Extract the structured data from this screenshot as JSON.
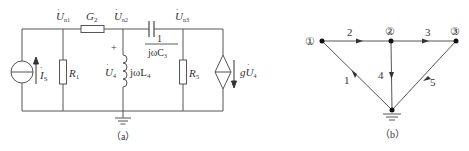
{
  "figure_a": {
    "caption": "（a）",
    "nodes": {
      "n1": {
        "label": "U",
        "sub": "n1"
      },
      "n2": {
        "label": "U",
        "sub": "n2"
      },
      "n3": {
        "label": "U",
        "sub": "n3"
      }
    },
    "components": {
      "current_source": {
        "label": "I",
        "sub": "S"
      },
      "r1": {
        "label": "R",
        "sub": "1"
      },
      "g2": {
        "label": "G",
        "sub": "2"
      },
      "inductor": {
        "label": "jωL",
        "sub": "4"
      },
      "u4": {
        "label": "U",
        "sub": "4",
        "polarity": "+"
      },
      "capacitor": {
        "numerator": "1",
        "denominator": "jωC",
        "sub": "3"
      },
      "r5": {
        "label": "R",
        "sub": "5"
      },
      "dep_source": {
        "label": "gU",
        "sub": "4"
      }
    }
  },
  "figure_b": {
    "caption": "（b）",
    "nodes": [
      {
        "id": "1",
        "label": "①"
      },
      {
        "id": "2",
        "label": "②"
      },
      {
        "id": "3",
        "label": "③"
      }
    ],
    "branches": [
      {
        "id": "1",
        "label": "1",
        "from": "ground",
        "to": "1"
      },
      {
        "id": "2",
        "label": "2",
        "from": "1",
        "to": "2"
      },
      {
        "id": "3",
        "label": "3",
        "from": "2",
        "to": "3"
      },
      {
        "id": "4",
        "label": "4",
        "from": "2",
        "to": "ground"
      },
      {
        "id": "5",
        "label": "5",
        "from": "3",
        "to": "ground"
      }
    ]
  },
  "colors": {
    "line": "#555555",
    "text": "#333333"
  }
}
